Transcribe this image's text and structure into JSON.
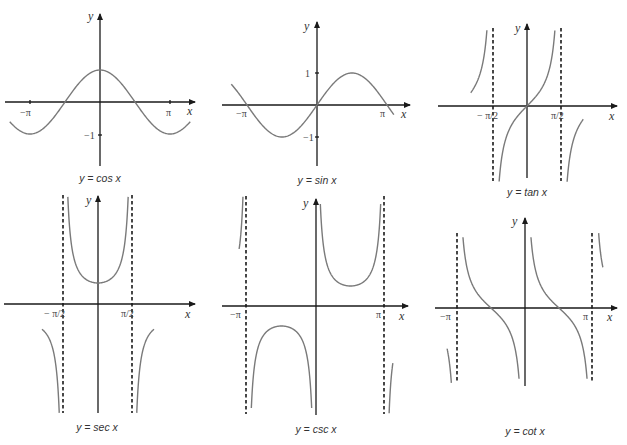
{
  "chart_data": [
    {
      "type": "line",
      "title": "y = cos x",
      "xlabel": "x",
      "ylabel": "y",
      "x_ticks": [
        "−π",
        "π"
      ],
      "y_ticks": [
        "−1"
      ],
      "x": [
        -4.2,
        -3.1416,
        -1.5708,
        0,
        1.5708,
        3.1416,
        4.2
      ],
      "series": [
        {
          "name": "cos x",
          "values": [
            -0.49,
            -1,
            0,
            1,
            0,
            -1,
            -0.49
          ]
        }
      ],
      "asymptotes": [],
      "ylim": [
        -2,
        3
      ],
      "grid": false
    },
    {
      "type": "line",
      "title": "y = sin x",
      "xlabel": "x",
      "ylabel": "y",
      "x_ticks": [
        "−π",
        "π"
      ],
      "y_ticks": [
        "1",
        "−1"
      ],
      "x": [
        -3.9,
        -3.1416,
        -1.5708,
        0,
        1.5708,
        3.1416,
        3.5
      ],
      "series": [
        {
          "name": "sin x",
          "values": [
            0.69,
            0,
            -1,
            0,
            1,
            0,
            -0.35
          ]
        }
      ],
      "asymptotes": [],
      "ylim": [
        -2,
        3
      ],
      "grid": false
    },
    {
      "type": "line",
      "title": "y = tan x",
      "xlabel": "x",
      "ylabel": "y",
      "x_ticks": [
        "−π/2",
        "π/2"
      ],
      "y_ticks": [],
      "x": [
        -1.3,
        -0.7854,
        0,
        0.7854,
        1.3
      ],
      "series": [
        {
          "name": "tan x",
          "values": [
            -3.6,
            -1,
            0,
            1,
            3.6
          ]
        }
      ],
      "asymptotes": [
        "x = −π/2",
        "x = π/2"
      ],
      "ylim": [
        -4,
        4
      ],
      "grid": false
    },
    {
      "type": "line",
      "title": "y = sec x",
      "xlabel": "x",
      "ylabel": "y",
      "x_ticks": [
        "−π/2",
        "π/2"
      ],
      "y_ticks": [],
      "x": [
        -1.3,
        -0.7854,
        0,
        0.7854,
        1.3
      ],
      "series": [
        {
          "name": "sec x",
          "values": [
            3.74,
            1.41,
            1,
            1.41,
            3.74
          ]
        }
      ],
      "asymptotes": [
        "x = −π/2",
        "x = π/2"
      ],
      "ylim": [
        -5,
        5
      ],
      "grid": false
    },
    {
      "type": "line",
      "title": "y = csc x",
      "xlabel": "x",
      "ylabel": "y",
      "x_ticks": [
        "−π",
        "π"
      ],
      "y_ticks": [],
      "x": [
        0.3,
        0.7854,
        1.5708,
        2.3562,
        2.84
      ],
      "series": [
        {
          "name": "csc x",
          "values": [
            3.38,
            1.41,
            1,
            1.41,
            3.38
          ]
        }
      ],
      "asymptotes": [
        "x = −π",
        "x = 0",
        "x = π"
      ],
      "ylim": [
        -5,
        5
      ],
      "grid": false
    },
    {
      "type": "line",
      "title": "y = cot x",
      "xlabel": "x",
      "ylabel": "y",
      "x_ticks": [
        "−π",
        "π"
      ],
      "y_ticks": [],
      "x": [
        0.25,
        0.7854,
        1.5708,
        2.3562,
        2.89
      ],
      "series": [
        {
          "name": "cot x",
          "values": [
            3.9,
            1,
            0,
            -1,
            -3.9
          ]
        }
      ],
      "asymptotes": [
        "x = −π",
        "x = 0",
        "x = π"
      ],
      "ylim": [
        -5,
        5
      ],
      "grid": false
    }
  ],
  "labels": {
    "x": "x",
    "y": "y",
    "neg_pi": "−π",
    "pi": "π",
    "one": "1",
    "neg_one": "−1",
    "neg_half_pi": "− π/2",
    "half_pi": "π/2"
  },
  "captions": {
    "cos": "y = cos x",
    "sin": "y = sin x",
    "tan": "y = tan x",
    "sec": "y = sec x",
    "csc": "y = csc x",
    "cot": "y = cot x"
  }
}
